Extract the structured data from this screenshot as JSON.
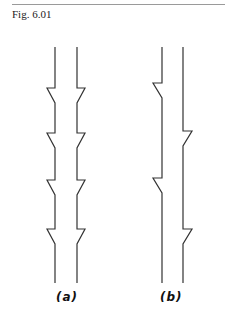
{
  "figure": {
    "caption": "Fig. 6.01",
    "stroke_color": "#333333",
    "panels": [
      {
        "id": "a",
        "label": "(a)",
        "description": "Two parallel vertical lines, each with four symmetric outward steps that taper back inward",
        "left_line_x": 55,
        "right_line_x": 77,
        "y_top": 47,
        "y_bottom": 283,
        "step_y": [
          88,
          133,
          180,
          229
        ],
        "step_depth": 8,
        "taper_length": 15
      },
      {
        "id": "b",
        "label": "(b)",
        "description": "Two parallel vertical lines with alternating single-sided steps: left line steps at two heights, right line steps at two offset heights",
        "left_line_x": 162,
        "right_line_x": 183,
        "y_top": 47,
        "y_bottom": 283,
        "left_step_y": [
          83,
          178
        ],
        "right_step_y": [
          131,
          229
        ],
        "step_depth": 9,
        "taper_length": 15
      }
    ]
  }
}
